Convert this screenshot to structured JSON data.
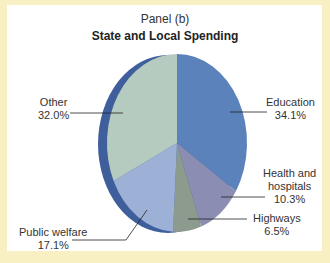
{
  "header": {
    "subtitle": "Panel (b)",
    "title": "State and Local Spending"
  },
  "labels": {
    "education": {
      "name": "Education",
      "value": "34.1%"
    },
    "health": {
      "name_line1": "Health and",
      "name_line2": "hospitals",
      "value": "10.3%"
    },
    "highways": {
      "name": "Highways",
      "value": "6.5%"
    },
    "welfare": {
      "name": "Public welfare",
      "value": "17.1%"
    },
    "other": {
      "name": "Other",
      "value": "32.0%"
    }
  },
  "colors": {
    "frame": "#f8efc2",
    "edge": "#3f5f9c",
    "leader": "#222222"
  },
  "chart_data": {
    "type": "pie",
    "title": "State and Local Spending",
    "subtitle": "Panel (b)",
    "categories": [
      "Education",
      "Health and hospitals",
      "Highways",
      "Public welfare",
      "Other"
    ],
    "values": [
      34.1,
      10.3,
      6.5,
      17.1,
      32.0
    ],
    "unit": "%",
    "colors": [
      "#5b82bb",
      "#8b8db3",
      "#8c9b8e",
      "#9db1d6",
      "#b6cbbf"
    ],
    "start_angle": "12 o'clock",
    "direction": "clockwise",
    "style": "3D tilted pie with blue edge on left",
    "legend": "none (direct labels with leader lines)"
  }
}
